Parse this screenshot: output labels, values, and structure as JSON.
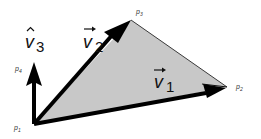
{
  "diagram": {
    "type": "vector-triangle",
    "colors": {
      "triangle_fill": "#c8c8c8",
      "stroke": "#000000",
      "edge": "#3a3a3a",
      "background": "#ffffff"
    },
    "points": [
      {
        "id": "p1",
        "label": "p",
        "sub": "1",
        "x": 34,
        "y": 124
      },
      {
        "id": "p2",
        "label": "p",
        "sub": "2",
        "x": 227,
        "y": 87
      },
      {
        "id": "p3",
        "label": "p",
        "sub": "3",
        "x": 131,
        "y": 20
      },
      {
        "id": "p4",
        "label": "p",
        "sub": "4",
        "x": 34,
        "y": 64
      }
    ],
    "vectors": [
      {
        "id": "v1",
        "symbol": "v",
        "sub": "1",
        "accent": "→",
        "from": "p1",
        "to": "p2"
      },
      {
        "id": "v2",
        "symbol": "v",
        "sub": "2",
        "accent": "→",
        "from": "p1",
        "to": "p3"
      },
      {
        "id": "v3",
        "symbol": "v",
        "sub": "3",
        "accent": "^",
        "from": "p1",
        "to": "p4"
      }
    ]
  },
  "labels": {
    "v1": {
      "main": "v",
      "sub": "1"
    },
    "v2": {
      "main": "v",
      "sub": "2"
    },
    "v3": {
      "main": "v",
      "sub": "3"
    },
    "p1": {
      "main": "p",
      "sub": "1"
    },
    "p2": {
      "main": "p",
      "sub": "2"
    },
    "p3": {
      "main": "p",
      "sub": "3"
    },
    "p4": {
      "main": "p",
      "sub": "4"
    }
  }
}
